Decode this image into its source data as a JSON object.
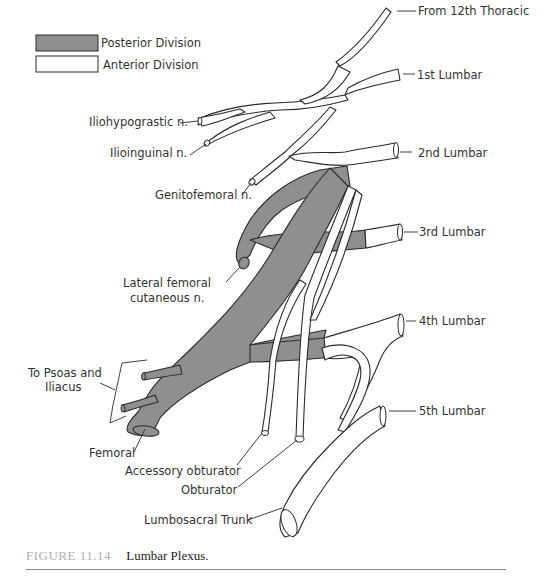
{
  "legend": {
    "items": [
      {
        "label": "Posterior Division",
        "fill": "#8f8f8f"
      },
      {
        "label": "Anterior Division",
        "fill": "#ffffff"
      }
    ]
  },
  "roots": [
    {
      "label": "From 12th Thoracic"
    },
    {
      "label": "1st Lumbar"
    },
    {
      "label": "2nd Lumbar"
    },
    {
      "label": "3rd Lumbar"
    },
    {
      "label": "4th Lumbar"
    },
    {
      "label": "5th Lumbar"
    }
  ],
  "branches": {
    "iliohypogastric": "Iliohypograstic n.",
    "ilioinguinal": "Ilioinguinal n.",
    "genitofemoral": "Genitofemoral n.",
    "lateral_femoral_line1": "Lateral femoral",
    "lateral_femoral_line2": "cutaneous n.",
    "psoas_line1": "To Psoas and",
    "psoas_line2": "Iliacus",
    "femoral": "Femoral",
    "accessory_obturator": "Accessory obturator",
    "obturator": "Obturator",
    "lumbosacral": "Lumbosacral Trunk"
  },
  "caption": {
    "figure_number": "FIGURE 11.14",
    "title": "Lumbar Plexus."
  },
  "colors": {
    "posterior": "#8f8f8f",
    "anterior": "#ffffff",
    "outline": "#2a2a2a"
  }
}
